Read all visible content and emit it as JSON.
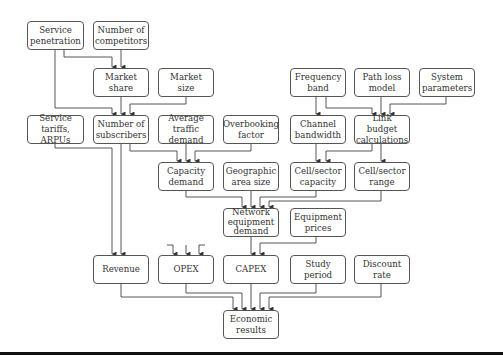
{
  "diagram": {
    "type": "flowchart",
    "title": "",
    "nodes": [
      {
        "id": "service-penetration",
        "label": "Service\npenetration",
        "x": 27,
        "y": 21,
        "w": 57,
        "h": 29
      },
      {
        "id": "number-of-competitors",
        "label": "Number of\ncompetitors",
        "x": 93,
        "y": 21,
        "w": 56,
        "h": 29
      },
      {
        "id": "market-share",
        "label": "Market\nshare",
        "x": 93,
        "y": 68,
        "w": 56,
        "h": 29
      },
      {
        "id": "market-size",
        "label": "Market\nsize",
        "x": 158,
        "y": 68,
        "w": 56,
        "h": 29
      },
      {
        "id": "frequency-band",
        "label": "Frequency\nband",
        "x": 290,
        "y": 68,
        "w": 56,
        "h": 29
      },
      {
        "id": "path-loss-model",
        "label": "Path loss\nmodel",
        "x": 354,
        "y": 68,
        "w": 56,
        "h": 29
      },
      {
        "id": "system-parameters",
        "label": "System\nparameters",
        "x": 419,
        "y": 68,
        "w": 56,
        "h": 29
      },
      {
        "id": "service-tariffs-arpus",
        "label": "Service tariffs,\nARPUs",
        "x": 27,
        "y": 115,
        "w": 57,
        "h": 29
      },
      {
        "id": "number-of-subscribers",
        "label": "Number of\nsubscribers",
        "x": 93,
        "y": 115,
        "w": 56,
        "h": 29
      },
      {
        "id": "average-traffic-demand",
        "label": "Average traffic\ndemand",
        "x": 158,
        "y": 115,
        "w": 56,
        "h": 29
      },
      {
        "id": "overbooking-factor",
        "label": "Overbooking\nfactor",
        "x": 223,
        "y": 115,
        "w": 56,
        "h": 29
      },
      {
        "id": "channel-bandwidth",
        "label": "Channel\nbandwidth",
        "x": 290,
        "y": 115,
        "w": 56,
        "h": 29
      },
      {
        "id": "link-budget-calculations",
        "label": "Link budget\ncalculations",
        "x": 354,
        "y": 115,
        "w": 56,
        "h": 29
      },
      {
        "id": "capacity-demand",
        "label": "Capacity\ndemand",
        "x": 158,
        "y": 162,
        "w": 56,
        "h": 29
      },
      {
        "id": "geographic-area-size",
        "label": "Geographic\narea size",
        "x": 223,
        "y": 162,
        "w": 56,
        "h": 29
      },
      {
        "id": "cell-sector-capacity",
        "label": "Cell/sector\ncapacity",
        "x": 290,
        "y": 162,
        "w": 56,
        "h": 29
      },
      {
        "id": "cell-sector-range",
        "label": "Cell/sector\nrange",
        "x": 354,
        "y": 162,
        "w": 56,
        "h": 29
      },
      {
        "id": "network-equipment-demand",
        "label": "Network\nequipment\ndemand",
        "x": 223,
        "y": 208,
        "w": 56,
        "h": 29
      },
      {
        "id": "equipment-prices",
        "label": "Equipment\nprices",
        "x": 290,
        "y": 208,
        "w": 56,
        "h": 29
      },
      {
        "id": "revenue",
        "label": "Revenue",
        "x": 93,
        "y": 255,
        "w": 56,
        "h": 29
      },
      {
        "id": "opex",
        "label": "OPEX",
        "x": 158,
        "y": 255,
        "w": 56,
        "h": 29
      },
      {
        "id": "capex",
        "label": "CAPEX",
        "x": 223,
        "y": 255,
        "w": 56,
        "h": 29
      },
      {
        "id": "study-period",
        "label": "Study\nperiod",
        "x": 290,
        "y": 255,
        "w": 56,
        "h": 29
      },
      {
        "id": "discount-rate",
        "label": "Discount\nrate",
        "x": 354,
        "y": 255,
        "w": 56,
        "h": 29
      },
      {
        "id": "economic-results",
        "label": "Economic\nresults",
        "x": 223,
        "y": 310,
        "w": 56,
        "h": 29
      }
    ],
    "edges": [
      {
        "from": "service-penetration",
        "to": "market-share"
      },
      {
        "from": "number-of-competitors",
        "to": "market-share"
      },
      {
        "from": "service-penetration",
        "to": "number-of-subscribers"
      },
      {
        "from": "market-share",
        "to": "number-of-subscribers"
      },
      {
        "from": "market-size",
        "to": "number-of-subscribers"
      },
      {
        "from": "frequency-band",
        "to": "channel-bandwidth"
      },
      {
        "from": "frequency-band",
        "to": "link-budget-calculations"
      },
      {
        "from": "path-loss-model",
        "to": "link-budget-calculations"
      },
      {
        "from": "system-parameters",
        "to": "link-budget-calculations"
      },
      {
        "from": "number-of-subscribers",
        "to": "capacity-demand"
      },
      {
        "from": "average-traffic-demand",
        "to": "capacity-demand"
      },
      {
        "from": "overbooking-factor",
        "to": "capacity-demand"
      },
      {
        "from": "channel-bandwidth",
        "to": "cell-sector-capacity"
      },
      {
        "from": "link-budget-calculations",
        "to": "cell-sector-capacity"
      },
      {
        "from": "link-budget-calculations",
        "to": "cell-sector-range"
      },
      {
        "from": "capacity-demand",
        "to": "network-equipment-demand"
      },
      {
        "from": "geographic-area-size",
        "to": "network-equipment-demand"
      },
      {
        "from": "cell-sector-capacity",
        "to": "network-equipment-demand"
      },
      {
        "from": "cell-sector-range",
        "to": "network-equipment-demand"
      },
      {
        "from": "network-equipment-demand",
        "to": "capex"
      },
      {
        "from": "equipment-prices",
        "to": "capex"
      },
      {
        "from": "service-tariffs-arpus",
        "to": "revenue"
      },
      {
        "from": "number-of-subscribers",
        "to": "revenue"
      },
      {
        "from": "unspecified-inputs",
        "to": "opex"
      },
      {
        "from": "revenue",
        "to": "economic-results"
      },
      {
        "from": "opex",
        "to": "economic-results"
      },
      {
        "from": "capex",
        "to": "economic-results"
      },
      {
        "from": "study-period",
        "to": "economic-results"
      },
      {
        "from": "discount-rate",
        "to": "economic-results"
      }
    ]
  },
  "style": {
    "line_color": "#444444",
    "box_border": "#555555",
    "text_color": "#333333",
    "bar_color": "#111111"
  }
}
